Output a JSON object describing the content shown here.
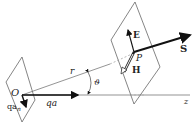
{
  "diagram": {
    "labels": {
      "origin": "O",
      "charge_accel": "qa",
      "charge_accel_normal_base": "qa",
      "charge_accel_normal_sub": "n",
      "radius": "r",
      "angle": "ϑ",
      "point": "P",
      "electric_field": "E",
      "magnetic_field": "H",
      "poynting": "S",
      "axis": "z"
    },
    "colors": {
      "line": "#555555",
      "arrow": "#111111",
      "text": "#222222"
    }
  }
}
